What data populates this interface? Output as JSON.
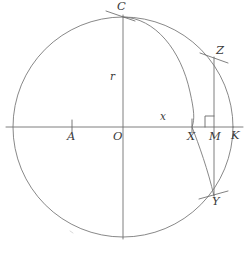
{
  "figure": {
    "type": "geometry-diagram",
    "background_color": "#ffffff",
    "ink_color": "#5a5a5a",
    "label_color": "#3a3a3a"
  },
  "labels": {
    "c": "C",
    "r": "r",
    "o": "O",
    "a": "A",
    "x_lower": "x",
    "x_upper": "X",
    "m": "M",
    "k": "K",
    "z": "Z",
    "y": "Y"
  },
  "geometry": {
    "center": {
      "x": 123,
      "y": 127
    },
    "radius": 110,
    "axis": {
      "x1": 6,
      "y1": 127,
      "x2": 243,
      "y2": 127
    },
    "vertical_diameter": {
      "x": 123,
      "y1": 17,
      "y2": 237
    },
    "points": {
      "C": {
        "x": 123,
        "y": 17
      },
      "O": {
        "x": 123,
        "y": 127
      },
      "A": {
        "x": 72,
        "y": 127
      },
      "X": {
        "x": 192,
        "y": 127
      },
      "M": {
        "x": 214,
        "y": 127
      },
      "K": {
        "x": 233,
        "y": 127
      },
      "Z": {
        "x": 214,
        "y": 57
      },
      "Y": {
        "x": 214,
        "y": 196
      }
    },
    "chord_ZY": {
      "x": 214,
      "y1": 57,
      "y2": 196
    },
    "right_angle_marker": {
      "at": "M",
      "size": 9,
      "opens": "upper-left"
    },
    "arc_CXY": {
      "from": "C",
      "through": "X",
      "to": "Y"
    }
  },
  "annotations": {
    "tick_marks": [
      "C",
      "A",
      "X",
      "Z",
      "Y"
    ],
    "segment_r": "vertical radius from O to C labelled r",
    "segment_x": "horizontal segment from O to X labelled x"
  }
}
